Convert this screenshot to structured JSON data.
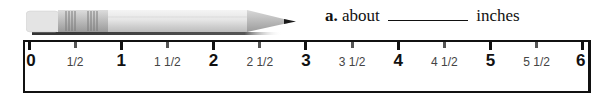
{
  "question": {
    "letter": "a.",
    "prefix": "about",
    "blank": "",
    "suffix": "inches"
  },
  "pencil": {
    "icon": "pencil-icon"
  },
  "ruler": {
    "unit": "inches",
    "labels": [
      {
        "text": "0",
        "type": "whole",
        "pos": 0
      },
      {
        "text": "1/2",
        "type": "half",
        "pos": 0.5
      },
      {
        "text": "1",
        "type": "whole",
        "pos": 1
      },
      {
        "text": "1 1/2",
        "type": "half",
        "pos": 1.5
      },
      {
        "text": "2",
        "type": "whole",
        "pos": 2
      },
      {
        "text": "2 1/2",
        "type": "half",
        "pos": 2.5
      },
      {
        "text": "3",
        "type": "whole",
        "pos": 3
      },
      {
        "text": "3 1/2",
        "type": "half",
        "pos": 3.5
      },
      {
        "text": "4",
        "type": "whole",
        "pos": 4
      },
      {
        "text": "4 1/2",
        "type": "half",
        "pos": 4.5
      },
      {
        "text": "5",
        "type": "whole",
        "pos": 5
      },
      {
        "text": "5 1/2",
        "type": "half",
        "pos": 5.5
      },
      {
        "text": "6",
        "type": "whole",
        "pos": 6
      }
    ]
  }
}
